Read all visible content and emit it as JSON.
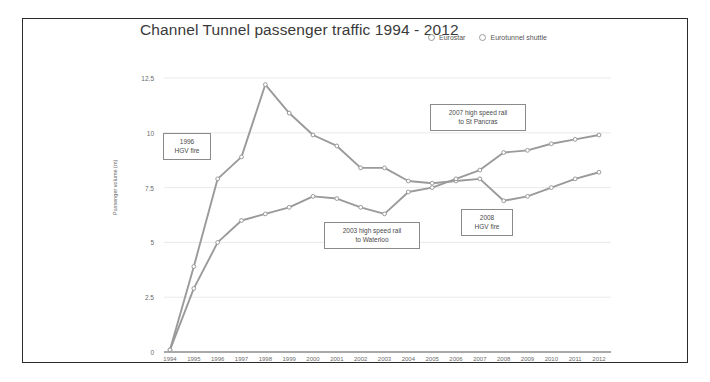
{
  "figure": {
    "title": "Channel Tunnel passenger traffic\n1994 - 2012",
    "border_color": "#2b2b2b",
    "series_color": "#9a9a9a",
    "grid_color": "#e3e3e3"
  },
  "legend": {
    "position": "top-right",
    "entries": [
      {
        "label": "Eurostar",
        "marker": "open-circle"
      },
      {
        "label": "Eurotunnel shuttle",
        "marker": "open-circle"
      }
    ]
  },
  "annotations": [
    {
      "name": "annotation-1996-hgv-fire",
      "text": "1996\nHGV fire",
      "x": 163,
      "y": 133,
      "w": 48,
      "h": 27
    },
    {
      "name": "annotation-2003-high-speed-rail",
      "text": "2003 high speed rail\nto Waterloo",
      "x": 324,
      "y": 222,
      "w": 96,
      "h": 27
    },
    {
      "name": "annotation-2007-high-speed-rail",
      "text": "2007 high speed rail\nto St Pancras",
      "x": 430,
      "y": 104,
      "w": 96,
      "h": 27
    },
    {
      "name": "annotation-2008-hgv-fire",
      "text": "2008\nHGV fire",
      "x": 461,
      "y": 209,
      "w": 52,
      "h": 27
    }
  ],
  "chart_data": {
    "type": "line",
    "title": "Channel Tunnel passenger traffic 1994 - 2012",
    "xlabel": "",
    "ylabel": "Passenger volume (m)",
    "ylim": [
      0,
      12.5
    ],
    "yticks": [
      "0",
      "2.5",
      "5",
      "7.5",
      "10",
      "12.5"
    ],
    "ytick_values": [
      0,
      2.5,
      5,
      7.5,
      10,
      12.5
    ],
    "grid": true,
    "categories": [
      "1994",
      "1995",
      "1996",
      "1997",
      "1998",
      "1999",
      "2000",
      "2001",
      "2002",
      "2003",
      "2004",
      "2005",
      "2006",
      "2007",
      "2008",
      "2009",
      "2010",
      "2011",
      "2012"
    ],
    "series": [
      {
        "name": "Eurotunnel shuttle",
        "values": [
          0.1,
          3.9,
          7.9,
          8.9,
          12.2,
          10.9,
          9.9,
          9.4,
          8.4,
          8.4,
          7.8,
          7.7,
          7.8,
          7.9,
          6.9,
          7.1,
          7.5,
          7.9,
          8.2
        ]
      },
      {
        "name": "Eurostar",
        "values": [
          0.1,
          2.9,
          5.0,
          6.0,
          6.3,
          6.6,
          7.1,
          7.0,
          6.6,
          6.3,
          7.3,
          7.5,
          7.9,
          8.3,
          9.1,
          9.2,
          9.5,
          9.7,
          9.9
        ]
      }
    ]
  }
}
